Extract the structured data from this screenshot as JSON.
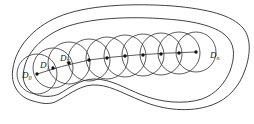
{
  "figure": {
    "type": "geometric-diagram",
    "background_color": "#ffffff",
    "stroke_color": "#333333",
    "outline_color": "#2b2b2b",
    "dot_color": "#111111",
    "canvas": {
      "width": 254,
      "height": 124
    }
  },
  "labels": [
    {
      "id": "D0",
      "text": "D",
      "subscript": "0",
      "x": 22,
      "y": 78
    },
    {
      "id": "D1",
      "text": "D",
      "subscript": "1",
      "x": 40,
      "y": 68
    },
    {
      "id": "D2",
      "text": "D",
      "subscript": "2",
      "x": 60,
      "y": 61
    },
    {
      "id": "Dn",
      "text": "D",
      "subscript": "n",
      "x": 210,
      "y": 58
    }
  ],
  "disks": [
    {
      "id": "D0",
      "cx": 37,
      "cy": 74,
      "r": 20
    },
    {
      "id": "D1",
      "cx": 53,
      "cy": 68,
      "r": 20
    },
    {
      "id": "D2",
      "cx": 69,
      "cy": 63,
      "r": 21
    },
    {
      "id": "D3",
      "cx": 89,
      "cy": 60,
      "r": 21
    },
    {
      "id": "D4",
      "cx": 107,
      "cy": 58,
      "r": 21
    },
    {
      "id": "D5",
      "cx": 125,
      "cy": 56,
      "r": 21
    },
    {
      "id": "D6",
      "cx": 143,
      "cy": 55,
      "r": 21
    },
    {
      "id": "D7",
      "cx": 161,
      "cy": 54,
      "r": 21
    },
    {
      "id": "D8",
      "cx": 179,
      "cy": 53,
      "r": 21
    },
    {
      "id": "Dn",
      "cx": 196,
      "cy": 52,
      "r": 20
    }
  ],
  "centers": [
    {
      "id": "D0",
      "x": 37,
      "y": 74
    },
    {
      "id": "D1",
      "x": 53,
      "y": 68
    },
    {
      "id": "D2",
      "x": 69,
      "y": 63
    },
    {
      "id": "D3",
      "x": 89,
      "y": 60
    },
    {
      "id": "D4",
      "x": 107,
      "y": 58
    },
    {
      "id": "D5",
      "x": 125,
      "y": 56
    },
    {
      "id": "D6",
      "x": 143,
      "y": 55
    },
    {
      "id": "D7",
      "x": 161,
      "y": 54
    },
    {
      "id": "D8",
      "x": 179,
      "y": 53
    },
    {
      "id": "Dn",
      "x": 196,
      "y": 52
    }
  ],
  "chain_path": "M 37 74 Q 60 66 89 60 Q 130 54 196 52",
  "outer_region_path": "M 33 101 C 18 97 10 84 13 68 C 16 48 32 28 58 17 C 86 5 132 3 173 6 C 207 9 232 15 243 28 C 252 39 250 56 245 70 C 240 85 229 99 212 105 C 190 113 163 110 142 101 C 122 93 108 84 92 85 C 78 86 66 97 55 102 C 48 105 40 103 33 101 Z",
  "inner_region_path": "M 37 95 C 26 91 21 81 24 69 C 27 53 41 37 63 28 C 88 18 130 16 166 19 C 196 21 219 27 228 38 C 236 47 234 60 230 71 C 225 83 216 94 202 99 C 183 105 160 102 142 95 C 124 88 111 79 94 79 C 80 79 68 89 59 94 C 52 97 44 97 37 95 Z"
}
